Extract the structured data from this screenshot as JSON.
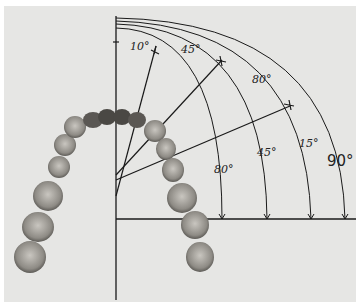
{
  "figure": {
    "labels": {
      "top_10": "10°",
      "top_45": "45°",
      "top_80": "80°",
      "arc_80": "80°",
      "arc_45": "45°",
      "arc_15": "15°",
      "arc_90": "90°"
    },
    "angles_deg": [
      10,
      45,
      80,
      15,
      90
    ],
    "colors": {
      "line": "#1a1a1a",
      "paper": "#e6e6e4",
      "tooth": "#a9a6a0",
      "tooth_dark": "#3a3835"
    }
  }
}
